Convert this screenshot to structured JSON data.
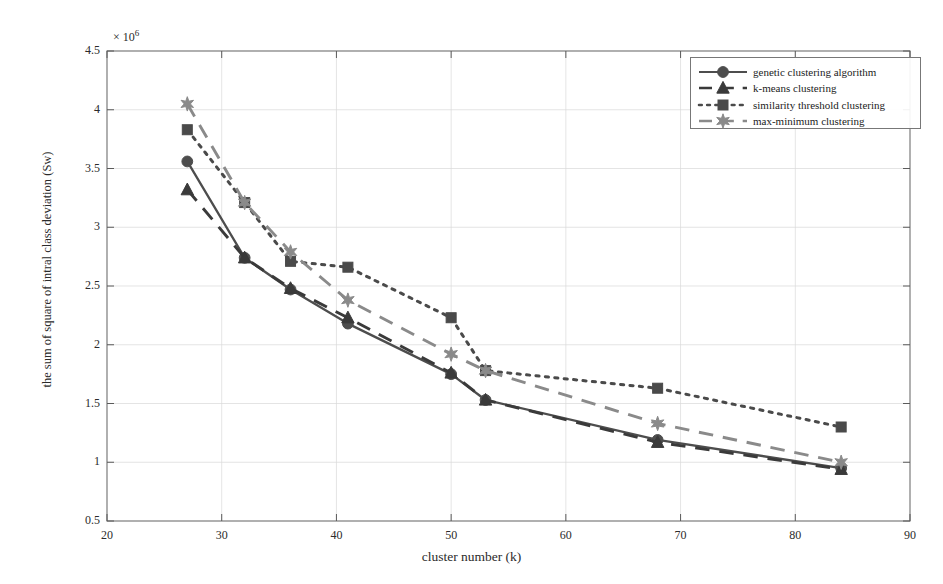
{
  "chart_data": {
    "type": "line",
    "title": "",
    "xlabel": "cluster number (k)",
    "ylabel": "the sum of square of intral class deviation (Sw)",
    "y_multiplier": "× 10",
    "y_multiplier_exp": "6",
    "xlim": [
      20,
      90
    ],
    "ylim": [
      0.5,
      4.5
    ],
    "xticks": [
      20,
      30,
      40,
      50,
      60,
      70,
      80,
      90
    ],
    "yticks": [
      0.5,
      1,
      1.5,
      2,
      2.5,
      3,
      3.5,
      4,
      4.5
    ],
    "xtick_labels": [
      "20",
      "30",
      "40",
      "50",
      "60",
      "70",
      "80",
      "90"
    ],
    "ytick_labels": [
      "0.5",
      "1",
      "1.5",
      "2",
      "2.5",
      "3",
      "3.5",
      "4",
      "4.5"
    ],
    "grid": true,
    "legend_position": "top-right",
    "series": [
      {
        "name": "genetic clustering algorithm",
        "marker": "circle",
        "linestyle": "solid",
        "color": "#4d4d4d",
        "x": [
          27,
          32,
          36,
          41,
          50,
          53,
          68,
          84
        ],
        "y": [
          3.56,
          2.74,
          2.47,
          2.18,
          1.75,
          1.53,
          1.19,
          0.95
        ]
      },
      {
        "name": "k-means clustering",
        "marker": "triangle",
        "linestyle": "dashed",
        "color": "#3a3a3a",
        "x": [
          27,
          32,
          36,
          41,
          50,
          53,
          68,
          84
        ],
        "y": [
          3.32,
          2.74,
          2.48,
          2.23,
          1.76,
          1.53,
          1.17,
          0.94
        ]
      },
      {
        "name": "similarity threshold clustering",
        "marker": "square",
        "linestyle": "dotted",
        "color": "#4a4a4a",
        "x": [
          27,
          32,
          36,
          41,
          50,
          53,
          68,
          84
        ],
        "y": [
          3.83,
          3.21,
          2.71,
          2.66,
          2.23,
          1.78,
          1.63,
          1.3
        ]
      },
      {
        "name": "max-minimum clustering",
        "marker": "star",
        "linestyle": "dashed",
        "color": "#8a8a8a",
        "x": [
          27,
          32,
          36,
          41,
          50,
          53,
          68,
          84
        ],
        "y": [
          4.05,
          3.21,
          2.79,
          2.38,
          1.92,
          1.78,
          1.33,
          1.0
        ]
      }
    ]
  },
  "legend": {
    "items": [
      "genetic clustering algorithm",
      "k-means clustering",
      "similarity threshold clustering",
      "max-minimum clustering"
    ]
  }
}
